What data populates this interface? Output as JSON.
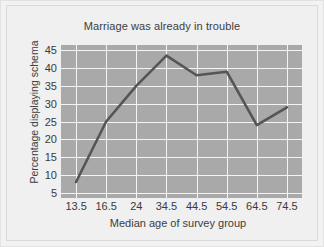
{
  "chart_data": {
    "type": "line",
    "title": "Marriage was already in trouble",
    "xlabel": "Median age of survey group",
    "ylabel": "Percentage displaying schema",
    "categories": [
      "13.5",
      "16.5",
      "24",
      "34.5",
      "44.5",
      "54.5",
      "64.5",
      "74.5"
    ],
    "values": [
      8,
      25,
      35,
      43.5,
      38,
      39,
      24,
      29
    ],
    "series": [
      {
        "name": "Percentage displaying schema",
        "values": [
          8,
          25,
          35,
          43.5,
          38,
          39,
          24,
          29
        ]
      }
    ],
    "yticks": [
      5,
      10,
      15,
      20,
      25,
      30,
      35,
      40,
      45
    ],
    "ylim": [
      3.5,
      46.5
    ],
    "grid": true,
    "legend": false,
    "colors": {
      "plot_background": "#a9a9a9",
      "gridline": "#f4f4f4",
      "line": "#555555",
      "page_background": "#f0f0f0",
      "text": "#3a3a3a"
    }
  }
}
